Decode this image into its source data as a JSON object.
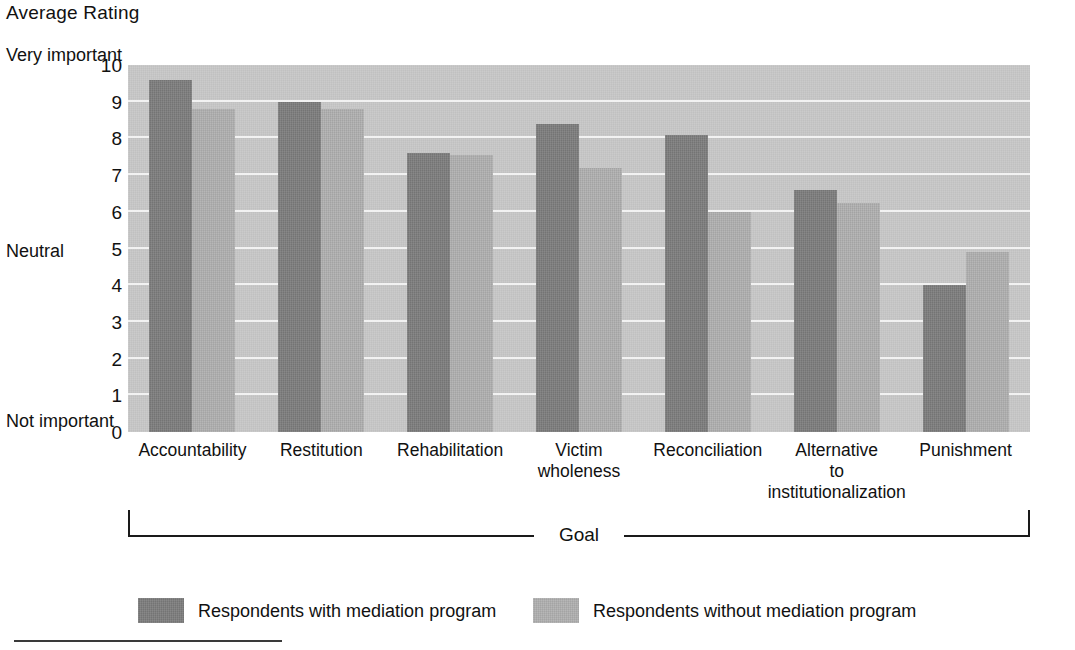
{
  "chart_data": {
    "type": "bar",
    "title": "Average Rating",
    "xlabel": "Goal",
    "ylabel": "Average Rating",
    "ylim": [
      0,
      10
    ],
    "grid": true,
    "legend_position": "bottom",
    "y_ticks": [
      "10",
      "9",
      "8",
      "7",
      "6",
      "5",
      "4",
      "3",
      "2",
      "1",
      "0"
    ],
    "y_anchor_labels": [
      {
        "text": "Very\nimportant",
        "value": 10
      },
      {
        "text": "Neutral",
        "value": 5
      },
      {
        "text": "Not\nimportant",
        "value": 0
      }
    ],
    "categories": [
      "Accountability",
      "Restitution",
      "Rehabilitation",
      "Victim\nwholeness",
      "Reconciliation",
      "Alternative\nto\ninstitutionalization",
      "Punishment"
    ],
    "series": [
      {
        "name": "Respondents with mediation program",
        "color": "#7d7d7d",
        "values": [
          9.6,
          9.0,
          7.6,
          8.4,
          8.1,
          6.6,
          4.0
        ]
      },
      {
        "name": "Respondents without mediation program",
        "color": "#b0b0b0",
        "values": [
          8.8,
          8.8,
          7.55,
          7.2,
          6.0,
          6.25,
          4.9
        ]
      }
    ]
  },
  "axis_bracket": {
    "label": "Goal"
  },
  "colors": {
    "plot_background": "#c7c7c7",
    "gridline": "#f2f2f2",
    "series_dark": "#7d7d7d",
    "series_light": "#b0b0b0",
    "text": "#111111"
  }
}
